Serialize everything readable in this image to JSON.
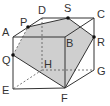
{
  "diagram": {
    "colors": {
      "edge": "#333333",
      "section_fill": "#cfcfcf",
      "point": "#111111",
      "background": "#ffffff"
    },
    "vertices": {
      "A": {
        "label": "A",
        "x": 13,
        "y": 37,
        "lx": 2,
        "ly": 36
      },
      "B": {
        "label": "B",
        "x": 65,
        "y": 37,
        "lx": 66,
        "ly": 47
      },
      "C": {
        "label": "C",
        "x": 94,
        "y": 18,
        "lx": 97,
        "ly": 18
      },
      "D": {
        "label": "D",
        "x": 42,
        "y": 18,
        "lx": 38,
        "ly": 14
      },
      "E": {
        "label": "E",
        "x": 13,
        "y": 89,
        "lx": 2,
        "ly": 94
      },
      "F": {
        "label": "F",
        "x": 65,
        "y": 88,
        "lx": 61,
        "ly": 102
      },
      "G": {
        "label": "G",
        "x": 94,
        "y": 70,
        "lx": 97,
        "ly": 75
      },
      "H": {
        "label": "H",
        "x": 42,
        "y": 70,
        "lx": 44,
        "ly": 68
      }
    },
    "points": {
      "P": {
        "label": "P",
        "x": 28,
        "y": 27,
        "lx": 20,
        "ly": 26
      },
      "S": {
        "label": "S",
        "x": 68,
        "y": 18,
        "lx": 64,
        "ly": 12
      },
      "R": {
        "label": "R",
        "x": 94,
        "y": 37,
        "lx": 97,
        "ly": 46
      },
      "Q": {
        "label": "Q",
        "x": 13,
        "y": 55,
        "lx": 2,
        "ly": 64
      }
    },
    "section": [
      "P",
      "S",
      "R",
      "F",
      "Q"
    ]
  }
}
